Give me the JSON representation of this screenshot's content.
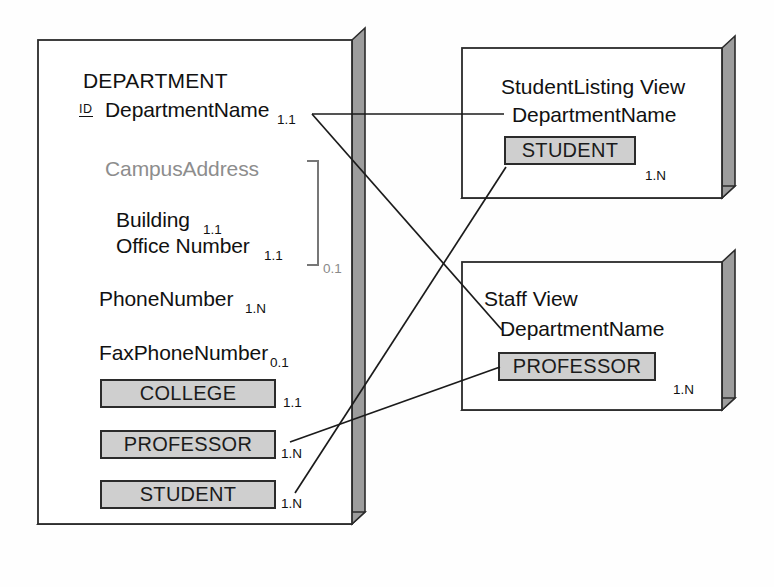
{
  "diagram": {
    "type": "entity-relationship-view-diagram",
    "shadow_color": "#9a9a9a",
    "entity_fill": "#cfcfcf",
    "gray_text": "#8d8d8d"
  },
  "department": {
    "title": "DEPARTMENT",
    "id_tag": "ID",
    "primary_key": {
      "name": "DepartmentName",
      "cardinality": "1.1"
    },
    "group": {
      "name": "CampusAddress",
      "cardinality": "0.1",
      "members": [
        {
          "name": "Building",
          "cardinality": "1.1"
        },
        {
          "name": "Office Number",
          "cardinality": "1.1"
        }
      ]
    },
    "attributes": [
      {
        "name": "PhoneNumber",
        "cardinality": "1.N"
      },
      {
        "name": "FaxPhoneNumber",
        "cardinality": "0.1"
      }
    ],
    "entities": [
      {
        "name": "COLLEGE",
        "cardinality": "1.1"
      },
      {
        "name": "PROFESSOR",
        "cardinality": "1.N"
      },
      {
        "name": "STUDENT",
        "cardinality": "1.N"
      }
    ]
  },
  "student_listing_view": {
    "title": "StudentListing View",
    "attribute": "DepartmentName",
    "entity": {
      "name": "STUDENT",
      "cardinality": "1.N"
    }
  },
  "staff_view": {
    "title": "Staff View",
    "attribute": "DepartmentName",
    "entity": {
      "name": "PROFESSOR",
      "cardinality": "1.N"
    }
  }
}
